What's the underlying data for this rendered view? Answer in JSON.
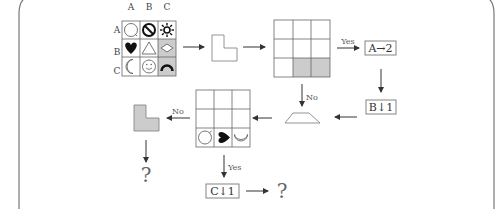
{
  "diagram": {
    "source_grid": {
      "column_labels": [
        "A",
        "B",
        "C"
      ],
      "row_labels": [
        "A",
        "B",
        "C"
      ],
      "cells": [
        [
          "circle-icon",
          "prohibited-icon",
          "sun-icon"
        ],
        [
          "heart-icon",
          "triangle-icon",
          "diamond-icon"
        ],
        [
          "moon-icon",
          "smiley-icon",
          "arch-icon"
        ]
      ],
      "shaded_cells": [
        "B-C",
        "C-C"
      ]
    },
    "target_grid": {
      "shaded_cells": [
        "C-B",
        "C-C"
      ]
    },
    "result_grid": {
      "bottom_row": [
        "rotated-circle-icon",
        "rotated-heart-icon",
        "rotated-moon-icon"
      ]
    },
    "labels": {
      "yes_1": "Yes",
      "no_1": "No",
      "no_2": "No",
      "yes_2": "Yes",
      "op_a": "A→2",
      "op_b": "B↓1",
      "op_c": "C↓1",
      "question_1": "?",
      "question_2": "?"
    },
    "colors": {
      "line": "#555555",
      "shade": "#cccccc",
      "frame": "#777777"
    }
  }
}
